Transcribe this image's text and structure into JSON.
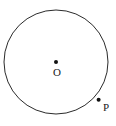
{
  "figure": {
    "type": "geometry-diagram",
    "background_color": "#ffffff",
    "stroke_color": "#2b2b2b",
    "point_color": "#111111",
    "label_color": "#1a1a1a",
    "canvas": {
      "width": 116,
      "height": 126
    },
    "circle": {
      "center_x": 56,
      "center_y": 62,
      "radius": 52,
      "stroke_width": 1
    },
    "points": [
      {
        "id": "center",
        "label": "O",
        "x": 56,
        "y": 62,
        "radius": 2,
        "label_x": 53,
        "label_y": 67
      },
      {
        "id": "on-circle",
        "label": "P",
        "x": 98.6,
        "y": 99.8,
        "radius": 2,
        "label_x": 103,
        "label_y": 102
      }
    ]
  }
}
